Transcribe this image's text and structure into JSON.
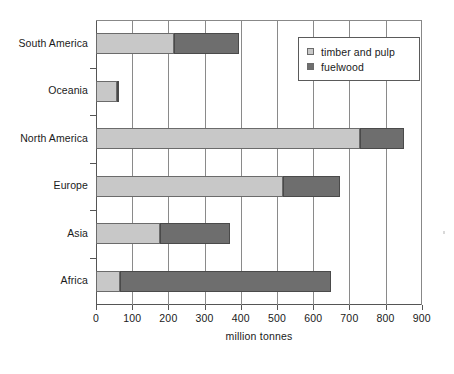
{
  "chart_data": {
    "type": "bar",
    "orientation": "horizontal",
    "stacked": true,
    "title": "",
    "xlabel": "million tonnes",
    "ylabel": "",
    "xlim": [
      0,
      900
    ],
    "xticks": [
      0,
      100,
      200,
      300,
      400,
      500,
      600,
      700,
      800,
      900
    ],
    "xticklabels": [
      "0",
      "100",
      "200",
      "300",
      "400",
      "500",
      "600",
      "700",
      "800",
      "900"
    ],
    "grid": "vertical",
    "legend_position": "top-right",
    "categories": [
      "Africa",
      "Asia",
      "Europe",
      "North America",
      "Oceania",
      "South America"
    ],
    "categories_top_to_bottom": [
      "South America",
      "Oceania",
      "North America",
      "Europe",
      "Asia",
      "Africa"
    ],
    "series": [
      {
        "name": "timber and pulp",
        "color": "#c8c8c8",
        "values": [
          67,
          177,
          517,
          729,
          58,
          215
        ]
      },
      {
        "name": "fuelwood",
        "color": "#6e6e6e",
        "values": [
          583,
          193,
          157,
          122,
          4,
          180
        ]
      }
    ],
    "totals": [
      650,
      370,
      674,
      851,
      62,
      395
    ]
  },
  "axis": {
    "x_title": "million tonnes",
    "tick_labels": [
      "0",
      "100",
      "200",
      "300",
      "400",
      "500",
      "600",
      "700",
      "800",
      "900"
    ],
    "category_labels": [
      "South America",
      "Oceania",
      "North America",
      "Europe",
      "Asia",
      "Africa"
    ]
  },
  "legend": {
    "entries": [
      {
        "label": "timber and pulp",
        "color": "#c8c8c8",
        "swatch_icon": "square-light-swatch"
      },
      {
        "label": "fuelwood",
        "color": "#6e6e6e",
        "swatch_icon": "square-dark-swatch"
      }
    ]
  },
  "colors": {
    "timber": "#c8c8c8",
    "fuelwood": "#6e6e6e",
    "axis": "#555555",
    "grid": "#8a8a8a",
    "background": "#ffffff",
    "text": "#1a1a1a"
  }
}
